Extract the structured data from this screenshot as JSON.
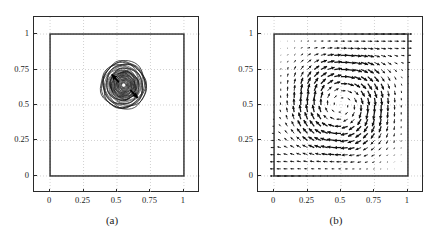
{
  "figure": {
    "background": "#ffffff",
    "axis_color": "#2a2a2a",
    "grid_color": "#bfbfbf",
    "ink_color": "#1a1a1a"
  },
  "panels": [
    {
      "id": "a",
      "caption": "(a)",
      "xticks": [
        "0",
        "0.25",
        "0.5",
        "0.75",
        "1"
      ],
      "yticks": [
        "1",
        "0.75",
        "0.5",
        "0.25",
        "0"
      ]
    },
    {
      "id": "b",
      "caption": "(b)",
      "xticks": [
        "0",
        "0.25",
        "0.5",
        "0.75",
        "1"
      ],
      "yticks": [
        "1",
        "0.75",
        "0.5",
        "0.25",
        "0"
      ]
    }
  ],
  "chart_data": [
    {
      "type": "contour",
      "panel": "(a)",
      "title": "",
      "xlabel": "",
      "ylabel": "",
      "xlim": [
        -0.12,
        1.12
      ],
      "ylim": [
        -0.12,
        1.12
      ],
      "xticks": [
        0,
        0.25,
        0.5,
        0.75,
        1
      ],
      "yticks": [
        0,
        0.25,
        0.5,
        0.75,
        1
      ],
      "grid": true,
      "legend": "none",
      "domain_square": {
        "x0": 0,
        "y0": 0,
        "x1": 1,
        "y1": 1
      },
      "contour_center": [
        0.55,
        0.64
      ],
      "contour_outer_radius": 0.17,
      "contour_levels": 26,
      "contour_center_hole_radius": 0.012,
      "annotations": [
        {
          "type": "arrow",
          "x": 0.515,
          "y": 0.66,
          "dx": -0.055,
          "dy": 0.055,
          "label": "vortex-arrow-upper-left"
        },
        {
          "type": "arrow",
          "x": 0.6,
          "y": 0.605,
          "dx": 0.055,
          "dy": -0.055,
          "label": "vortex-arrow-lower-right"
        }
      ]
    },
    {
      "type": "quiver",
      "panel": "(b)",
      "title": "",
      "xlabel": "",
      "ylabel": "",
      "xlim": [
        -0.12,
        1.12
      ],
      "ylim": [
        -0.12,
        1.12
      ],
      "xticks": [
        0,
        0.25,
        0.5,
        0.75,
        1
      ],
      "yticks": [
        0,
        0.25,
        0.5,
        0.75,
        1
      ],
      "grid": true,
      "legend": "none",
      "domain_square": {
        "x0": 0,
        "y0": 0,
        "x1": 1,
        "y1": 1
      },
      "grid_nx": 20,
      "grid_ny": 20,
      "arrow_scale": 0.055,
      "description": "Circulating velocity field: strong leftward horizontal arrows along the lower-left edge, strong rightward horizontal arrows along the upper-right edge, diagonal up-right arrows through the interior, small upward arrows at lower-right.",
      "field_model": {
        "u_expr": "sin(pi*x)^2 * sin(2*pi*y) * -1",
        "v_expr": "sin(2*pi*x) * sin(pi*y)^2",
        "note": "Taylor-Green style cavity circulation, single clockwise-reversed cell"
      }
    }
  ]
}
